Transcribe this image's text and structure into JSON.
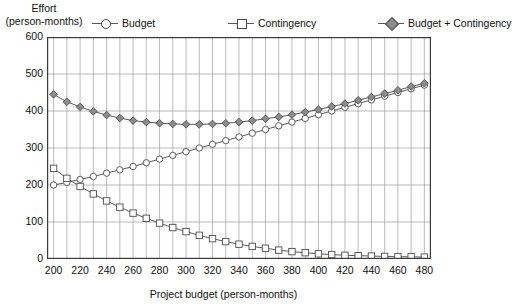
{
  "axis_titles": {
    "y_line1": "Effort",
    "y_line2": "(person-months)",
    "x": "Project budget (person-months)"
  },
  "legend": {
    "budget": {
      "label": "Budget",
      "marker": "open-circle-icon"
    },
    "contingency": {
      "label": "Contingency",
      "marker": "open-square-icon"
    },
    "sum": {
      "label": "Budget + Contingency",
      "marker": "filled-diamond-icon"
    }
  },
  "colors": {
    "line": "#5a5a5a",
    "marker_fill_open": "#ffffff",
    "marker_fill_solid": "#8c8c8c",
    "marker_stroke": "#4d4d4d",
    "grid": "#8f8f8f",
    "axis": "#3a3a3a",
    "text": "#111111"
  },
  "chart_data": {
    "type": "line",
    "title": "",
    "xlabel": "Project budget (person-months)",
    "ylabel": "Effort (person-months)",
    "xlim": [
      195,
      485
    ],
    "ylim": [
      0,
      600
    ],
    "xticks": [
      200,
      220,
      240,
      260,
      280,
      300,
      320,
      340,
      360,
      380,
      400,
      420,
      440,
      460,
      480
    ],
    "yticks": [
      0,
      100,
      200,
      300,
      400,
      500,
      600
    ],
    "xtick_labels": [
      "200",
      "220",
      "240",
      "260",
      "280",
      "300",
      "320",
      "340",
      "360",
      "380",
      "400",
      "420",
      "440",
      "460",
      "480"
    ],
    "ytick_labels": [
      "0",
      "100",
      "200",
      "300",
      "400",
      "500",
      "600"
    ],
    "grid": true,
    "grid_x_step": 10,
    "grid_y_step": 100,
    "legend_position": "top",
    "x": [
      200,
      210,
      220,
      230,
      240,
      250,
      260,
      270,
      280,
      290,
      300,
      310,
      320,
      330,
      340,
      350,
      360,
      370,
      380,
      390,
      400,
      410,
      420,
      430,
      440,
      450,
      460,
      470,
      480
    ],
    "series": [
      {
        "name": "Budget",
        "marker": "open-circle",
        "values": [
          200,
          207,
          215,
          223,
          232,
          241,
          250,
          260,
          270,
          280,
          290,
          300,
          310,
          320,
          330,
          340,
          350,
          360,
          370,
          380,
          390,
          400,
          410,
          420,
          430,
          440,
          450,
          460,
          470
        ]
      },
      {
        "name": "Contingency",
        "marker": "open-square",
        "values": [
          245,
          218,
          196,
          176,
          157,
          140,
          124,
          110,
          97,
          85,
          74,
          64,
          55,
          47,
          40,
          34,
          29,
          24,
          20,
          17,
          14,
          12,
          10,
          9,
          8,
          7,
          6,
          6,
          5
        ]
      },
      {
        "name": "Budget + Contingency",
        "marker": "filled-diamond",
        "values": [
          445,
          425,
          411,
          399,
          389,
          381,
          374,
          370,
          367,
          365,
          364,
          364,
          365,
          367,
          370,
          374,
          379,
          384,
          390,
          397,
          404,
          412,
          420,
          429,
          438,
          447,
          456,
          466,
          475
        ]
      }
    ]
  }
}
